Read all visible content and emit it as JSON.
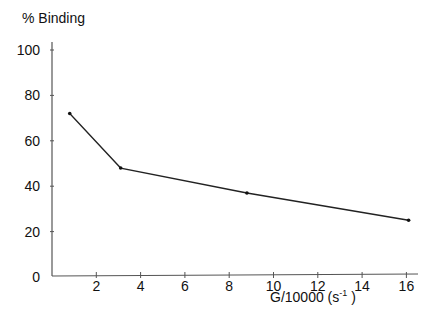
{
  "chart_data": {
    "type": "line",
    "title": "",
    "ylabel": "% Binding",
    "xlabel": "G/10000  (s",
    "xlabel_sup": "-1",
    "xlabel_close": ")",
    "xlim": [
      0,
      16.3
    ],
    "ylim": [
      0,
      100
    ],
    "x_ticks": [
      2,
      4,
      6,
      8,
      10,
      12,
      14,
      16
    ],
    "y_ticks": [
      0,
      20,
      40,
      60,
      80,
      100
    ],
    "grid": false,
    "series": [
      {
        "name": "% Binding",
        "x": [
          0.8,
          3.1,
          8.8,
          16.1
        ],
        "values": [
          72,
          48,
          37,
          25
        ]
      }
    ],
    "colors": {
      "line": "#222222",
      "axis": "#555555",
      "text": "#111111"
    }
  }
}
